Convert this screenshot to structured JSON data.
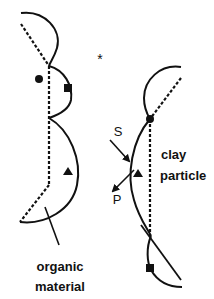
{
  "diagram": {
    "labels": {
      "organic_line1": "organic",
      "organic_line2": "material",
      "clay_line1": "clay",
      "clay_line2": "particle",
      "s_label": "S",
      "p_label": "P",
      "asterisk": "*"
    },
    "colors": {
      "ink": "#111111",
      "background": "#ffffff"
    },
    "markers": {
      "circle": "filled-circle",
      "square": "filled-square",
      "triangle": "filled-triangle"
    }
  }
}
